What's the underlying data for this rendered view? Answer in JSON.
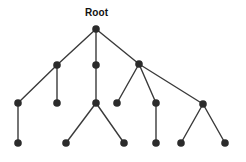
{
  "figure": {
    "title": "Root",
    "background_color": "#ffffff",
    "node_color": "#2b2b2b",
    "edge_color": "#3a3a3a",
    "label_color": "#111111",
    "width": 246,
    "height": 162
  },
  "labels": [
    {
      "id": "root-label",
      "text": "Root",
      "x": 85,
      "y": 8
    }
  ],
  "chart_data": {
    "type": "diagram",
    "diagram_kind": "tree",
    "title": "Root",
    "node_radius": 3.8,
    "levels": [
      29,
      65,
      103,
      143
    ],
    "nodes": [
      {
        "id": "n0",
        "label": "Root",
        "x": 96,
        "y": 29,
        "level": 0
      },
      {
        "id": "n1",
        "label": "",
        "x": 57,
        "y": 65,
        "level": 1
      },
      {
        "id": "n2",
        "label": "",
        "x": 96,
        "y": 65,
        "level": 1
      },
      {
        "id": "n3",
        "label": "",
        "x": 139,
        "y": 64,
        "level": 1
      },
      {
        "id": "n4",
        "label": "",
        "x": 18,
        "y": 103,
        "level": 2
      },
      {
        "id": "n5",
        "label": "",
        "x": 57,
        "y": 103,
        "level": 2
      },
      {
        "id": "n6",
        "label": "",
        "x": 96,
        "y": 103,
        "level": 2
      },
      {
        "id": "n7",
        "label": "",
        "x": 117,
        "y": 103,
        "level": 2
      },
      {
        "id": "n8",
        "label": "",
        "x": 156,
        "y": 103,
        "level": 2
      },
      {
        "id": "n9",
        "label": "",
        "x": 203,
        "y": 104,
        "level": 2
      },
      {
        "id": "n10",
        "label": "",
        "x": 18,
        "y": 143,
        "level": 3
      },
      {
        "id": "n11",
        "label": "",
        "x": 66,
        "y": 143,
        "level": 3
      },
      {
        "id": "n12",
        "label": "",
        "x": 124,
        "y": 143,
        "level": 3
      },
      {
        "id": "n13",
        "label": "",
        "x": 156,
        "y": 143,
        "level": 3
      },
      {
        "id": "n14",
        "label": "",
        "x": 181,
        "y": 143,
        "level": 3
      },
      {
        "id": "n15",
        "label": "",
        "x": 225,
        "y": 143,
        "level": 3
      }
    ],
    "edges": [
      {
        "from": "n0",
        "to": "n1"
      },
      {
        "from": "n0",
        "to": "n2"
      },
      {
        "from": "n0",
        "to": "n3"
      },
      {
        "from": "n1",
        "to": "n4"
      },
      {
        "from": "n1",
        "to": "n5"
      },
      {
        "from": "n2",
        "to": "n6"
      },
      {
        "from": "n3",
        "to": "n7"
      },
      {
        "from": "n3",
        "to": "n8"
      },
      {
        "from": "n3",
        "to": "n9"
      },
      {
        "from": "n4",
        "to": "n10"
      },
      {
        "from": "n6",
        "to": "n11"
      },
      {
        "from": "n6",
        "to": "n12"
      },
      {
        "from": "n8",
        "to": "n13"
      },
      {
        "from": "n9",
        "to": "n14"
      },
      {
        "from": "n9",
        "to": "n15"
      }
    ],
    "node_count": 16,
    "edge_count": 15,
    "depth": 4
  }
}
